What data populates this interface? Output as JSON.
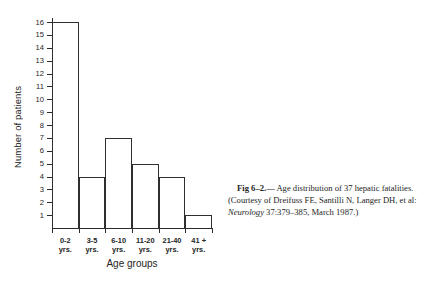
{
  "figure": {
    "caption": {
      "figure_number": "Fig 6–2.",
      "separator": "— ",
      "text_before_journal": "Age distribution of 37 hepatic fatalities. (Courtesy of Dreifuss FE, Santilli N, Langer DH, et al: ",
      "journal": "Neurology",
      "text_after_journal": " 37:379–385, March 1987.)"
    }
  },
  "chart_data": {
    "type": "bar",
    "title": "",
    "xlabel": "Age groups",
    "ylabel": "Number of patients",
    "categories": [
      "0-2 yrs.",
      "3-5 yrs.",
      "6-10 yrs.",
      "11-20 yrs.",
      "21-40 yrs.",
      "41 + yrs."
    ],
    "category_lines": [
      [
        "0-2",
        "yrs."
      ],
      [
        "3-5",
        "yrs."
      ],
      [
        "6-10",
        "yrs."
      ],
      [
        "11-20",
        "yrs."
      ],
      [
        "21-40",
        "yrs."
      ],
      [
        "41 +",
        "yrs."
      ]
    ],
    "values": [
      16,
      4,
      7,
      5,
      4,
      1
    ],
    "total": 37,
    "ylim": [
      0,
      16
    ],
    "yticks": [
      1,
      2,
      3,
      4,
      5,
      6,
      7,
      8,
      9,
      10,
      11,
      12,
      13,
      14,
      15,
      16
    ],
    "ytick_labels": [
      "1",
      "2",
      "3",
      "4",
      "5",
      "6",
      "7",
      "8",
      "9",
      "10",
      "11",
      "12",
      "13",
      "14",
      "15",
      "16"
    ],
    "grid": false,
    "legend": false,
    "bar_fill": "#ffffff",
    "bar_stroke": "#2f2f2f",
    "axis_color": "#2b2b2b",
    "background": "#ffffff"
  }
}
